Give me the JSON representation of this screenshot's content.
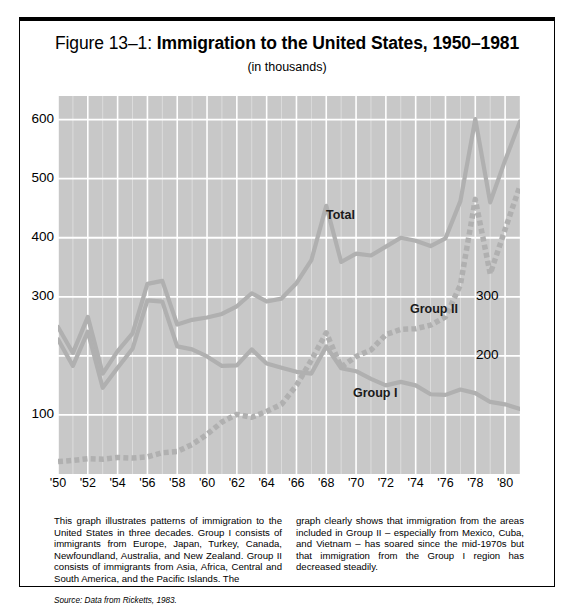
{
  "figure": {
    "number": "Figure 13–1:",
    "name": "Immigration to the United States, 1950–1981",
    "subtitle": "(in thousands)",
    "source": "Source: Data from Ricketts, 1983."
  },
  "caption": {
    "left": "This graph illustrates patterns of immigration to the United States in three decades. Group I consists of immigrants from Europe, Japan, Turkey, Canada, Newfoundland, Australia, and New Zealand. Group II consists of immigrants from Asia, Africa, Central and South America, and the Pacific Islands. The",
    "right": "graph clearly shows that immigration from the areas included in Group II – especially from Mexico, Cuba, and Vietnam – has soared since the mid-1970s but that immigration from the Group I region has decreased steadily."
  },
  "chart_data": {
    "type": "line",
    "title": "Immigration to the United States, 1950–1981",
    "subtitle": "(in thousands)",
    "xlabel": "",
    "ylabel": "",
    "ylim": [
      0,
      640
    ],
    "xlim": [
      1950,
      1981
    ],
    "grid": true,
    "grid_color": "#ffffff",
    "plot_bg": "#c8c8c8",
    "series_color": "#b0b0b0",
    "legend": "inline-labels",
    "y_axis_left": {
      "ticks": [
        600,
        500,
        400,
        300,
        200,
        100
      ],
      "labels": [
        "600",
        "500",
        "400",
        "300",
        "",
        "100"
      ]
    },
    "y_axis_right": {
      "ticks": [
        300,
        200
      ],
      "labels": [
        "300",
        "200"
      ]
    },
    "x_ticks": [
      1950,
      1952,
      1954,
      1956,
      1958,
      1960,
      1962,
      1964,
      1966,
      1968,
      1970,
      1972,
      1974,
      1976,
      1978,
      1980
    ],
    "x_tick_labels": [
      "'50",
      "'52",
      "'54",
      "'56",
      "'58",
      "'60",
      "'62",
      "'64",
      "'66",
      "'68",
      "'70",
      "'72",
      "'74",
      "'76",
      "'78",
      "'80"
    ],
    "x": [
      1950,
      1951,
      1952,
      1953,
      1954,
      1955,
      1956,
      1957,
      1958,
      1959,
      1960,
      1961,
      1962,
      1963,
      1964,
      1965,
      1966,
      1967,
      1968,
      1969,
      1970,
      1971,
      1972,
      1973,
      1974,
      1975,
      1976,
      1977,
      1978,
      1979,
      1980,
      1981
    ],
    "series": [
      {
        "name": "Total",
        "style": "solid",
        "values": [
          249,
          205,
          266,
          170,
          208,
          238,
          322,
          327,
          253,
          261,
          265,
          271,
          284,
          306,
          292,
          297,
          323,
          362,
          454,
          359,
          373,
          370,
          385,
          400,
          395,
          386,
          399,
          462,
          601,
          460,
          531,
          597
        ]
      },
      {
        "name": "Group I",
        "style": "solid",
        "values": [
          228,
          183,
          241,
          146,
          180,
          212,
          294,
          292,
          216,
          211,
          199,
          183,
          184,
          211,
          187,
          180,
          173,
          170,
          216,
          179,
          174,
          161,
          150,
          156,
          150,
          135,
          134,
          143,
          137,
          122,
          118,
          110
        ]
      },
      {
        "name": "Group II",
        "style": "dotted",
        "values": [
          21,
          23,
          26,
          25,
          28,
          27,
          29,
          36,
          38,
          50,
          67,
          88,
          101,
          96,
          106,
          118,
          150,
          193,
          239,
          181,
          199,
          210,
          236,
          245,
          246,
          252,
          266,
          320,
          465,
          339,
          414,
          488
        ]
      }
    ]
  }
}
